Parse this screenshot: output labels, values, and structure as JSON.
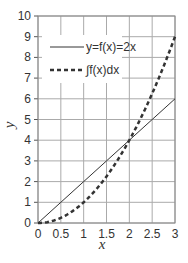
{
  "chart_data": {
    "type": "line",
    "title": "",
    "xlabel": "x",
    "ylabel": "y",
    "xlim": [
      0,
      3
    ],
    "ylim": [
      0,
      10
    ],
    "grid": true,
    "legend_position": "upper left",
    "x_ticks": [
      "0",
      "0.5",
      "1",
      "1.5",
      "2",
      "2.5",
      "3"
    ],
    "y_ticks": [
      "0",
      "1",
      "2",
      "3",
      "4",
      "5",
      "6",
      "7",
      "8",
      "9",
      "10"
    ],
    "series": [
      {
        "name": "y=f(x)=2x",
        "style": "solid",
        "x": [
          0,
          0.5,
          1,
          1.5,
          2,
          2.5,
          3
        ],
        "values": [
          0,
          1,
          2,
          3,
          4,
          5,
          6
        ]
      },
      {
        "name": "∫f(x)dx",
        "style": "dashed",
        "x": [
          0,
          0.5,
          1,
          1.5,
          2,
          2.5,
          3
        ],
        "values": [
          0,
          0.25,
          1,
          2.25,
          4,
          6.25,
          9
        ]
      }
    ]
  }
}
